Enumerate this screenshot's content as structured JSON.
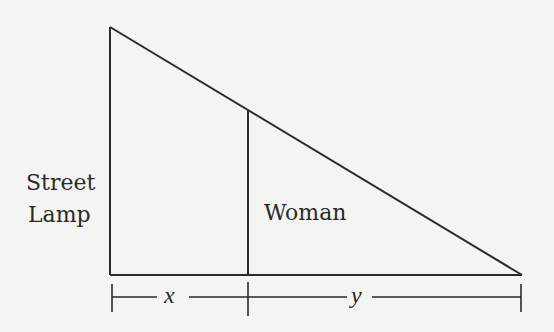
{
  "diagram": {
    "labels": {
      "lamp_line1": "Street",
      "lamp_line2": "Lamp",
      "woman": "Woman",
      "x": "x",
      "y": "y"
    },
    "colors": {
      "line": "#2a2a2a",
      "background": "#f4f4f2"
    }
  }
}
